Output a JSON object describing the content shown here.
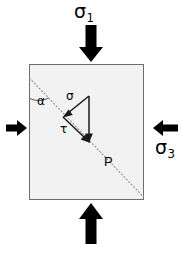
{
  "figure": {
    "type": "engineering-stress-diagram",
    "canvas": {
      "width": 189,
      "height": 258
    },
    "background_color": "#ffffff"
  },
  "element_block": {
    "name": "stress-element-block",
    "fill_color": "#f2f2f2",
    "stroke_color": "#6e6e6e",
    "x": 29,
    "y": 64,
    "width": 115,
    "height": 136
  },
  "failure_plane": {
    "name": "failure-plane",
    "style": "dotted",
    "stroke_color": "#8c8c8c",
    "x1": 29,
    "y1": 78,
    "x2": 144,
    "y2": 197,
    "angle_label": "α"
  },
  "labels": {
    "sigma1_symbol": "σ",
    "sigma1_subscript": "1",
    "sigma3_symbol": "σ",
    "sigma3_subscript": "3",
    "alpha": "α",
    "normal_stress": "σ",
    "shear_stress": "τ",
    "point": "P"
  },
  "arrows": {
    "major_color": "#000000",
    "items": [
      {
        "name": "sigma1-top-arrow",
        "direction": "down",
        "label": "σ₁",
        "description": "major principal stress acting downward on top face",
        "tip_x": 91,
        "tip_y": 62,
        "tail_y": 26,
        "shaft_width": 11,
        "head_width": 24,
        "head_length": 15
      },
      {
        "name": "sigma1-bottom-arrow",
        "direction": "up",
        "label": "σ₁",
        "description": "major principal stress acting upward on bottom face",
        "tip_x": 91,
        "tip_y": 203,
        "tail_y": 243,
        "shaft_width": 11,
        "head_width": 24,
        "head_length": 15
      },
      {
        "name": "sigma3-left-arrow",
        "direction": "right",
        "label": "",
        "description": "minor principal stress acting rightward on left face",
        "tip_x": 27,
        "tip_y": 128,
        "tail_x": 6,
        "shaft_height": 7,
        "head_height": 15,
        "head_length": 9
      },
      {
        "name": "sigma3-right-arrow",
        "direction": "left",
        "label": "σ₃",
        "description": "minor principal stress acting leftward on right face",
        "tip_x": 146,
        "tip_y": 128,
        "tail_x": 178,
        "shaft_height": 7,
        "head_height": 15,
        "head_length": 9
      }
    ]
  },
  "vector_triangle": {
    "name": "stress-resolution-triangle",
    "stroke_color": "#1a1a1a",
    "description": "resultant traction on the failure plane at point P resolved into normal component sigma and shear component tau",
    "apex": {
      "x": 89,
      "y": 96
    },
    "resultant": {
      "name": "resultant-vector",
      "label": "",
      "from": {
        "x": 89,
        "y": 96
      },
      "to": {
        "x": 89,
        "y": 141
      },
      "description": "vertical resultant traction vector pointing down"
    },
    "normal_component": {
      "name": "normal-stress-vector",
      "label": "σ",
      "from": {
        "x": 89,
        "y": 96
      },
      "to": {
        "x": 64,
        "y": 116
      },
      "description": "normal stress component arrow pointing down-left, perpendicular to failure plane"
    },
    "shear_component": {
      "name": "shear-stress-vector",
      "label": "τ",
      "from": {
        "x": 64,
        "y": 116
      },
      "to": {
        "x": 89,
        "y": 141
      },
      "description": "shear stress component arrow pointing down-right, parallel to failure plane"
    }
  },
  "angle_arc": {
    "name": "alpha-angle-arc",
    "label": "α",
    "vertex": {
      "x": 29,
      "y": 78
    },
    "between": [
      "failure-plane",
      "left-edge-of-block"
    ],
    "stroke_color": "#4d4d4d"
  },
  "point_marker": {
    "name": "point-p",
    "label": "P",
    "x": 104,
    "y": 155,
    "description": "labelled point on the failure plane"
  }
}
